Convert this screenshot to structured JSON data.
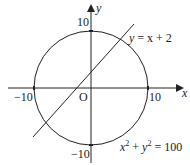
{
  "diagram": {
    "axes": {
      "x_label": "x",
      "y_label": "y",
      "origin_label": "O",
      "ticks": {
        "x_neg": "−10",
        "x_pos": "10",
        "y_pos": "10",
        "y_neg": "−10"
      }
    },
    "line": {
      "equation_lhs": "y",
      "equation_rhs": " = x + 2"
    },
    "circle": {
      "x_var": "x",
      "y_var": "y",
      "exp": "2",
      "plus": " + ",
      "equals": " = 100",
      "radius": 10
    },
    "colors": {
      "stroke": "#222222",
      "background": "#ffffff"
    }
  }
}
